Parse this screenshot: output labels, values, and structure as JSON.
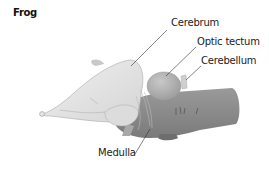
{
  "title": "Frog",
  "labels": {
    "cerebrum": "Cerebrum",
    "optic_tectum": "Optic tectum",
    "cerebellum": "Cerebellum",
    "medulla": "Medulla"
  },
  "colors": {
    "cerebrum": "#e4e4e4",
    "optic_tectum": "#b8b8b8",
    "brainstem": "#8a8a8a",
    "outline": "#9a9a9a"
  }
}
